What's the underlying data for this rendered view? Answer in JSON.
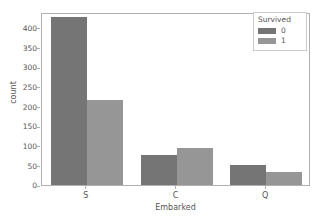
{
  "chart_data": {
    "type": "bar",
    "title": "",
    "xlabel": "Embarked",
    "ylabel": "count",
    "categories": [
      "S",
      "C",
      "Q"
    ],
    "series": [
      {
        "name": "0",
        "values": [
          427,
          77,
          50
        ],
        "color": "#757575"
      },
      {
        "name": "1",
        "values": [
          217,
          93,
          32
        ],
        "color": "#969696"
      }
    ],
    "legend": {
      "title": "Survived",
      "position": "upper right",
      "entries": [
        "0",
        "1"
      ]
    },
    "ylim": [
      0,
      440
    ],
    "yticks": [
      0,
      50,
      100,
      150,
      200,
      250,
      300,
      350,
      400
    ],
    "ytick_labels": [
      "0",
      "50",
      "100",
      "150",
      "200",
      "250",
      "300",
      "350",
      "400"
    ],
    "xtick_labels": [
      "S",
      "C",
      "Q"
    ],
    "grid": false,
    "axes_color": "#b0b0b0",
    "text_color": "#555555",
    "background": "#ffffff"
  }
}
